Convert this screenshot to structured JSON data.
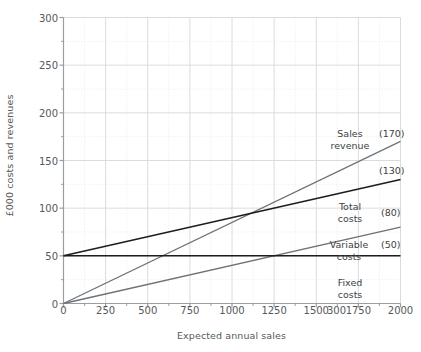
{
  "chart_data": {
    "type": "line",
    "title": "",
    "xlabel": "Expected annual sales",
    "ylabel": "£000 costs and revenues",
    "xlim": [
      0,
      2000
    ],
    "ylim": [
      0,
      300
    ],
    "grid": true,
    "legend_position": "inline-right-annotations",
    "x_ticks": [
      {
        "value": 0,
        "label": "0"
      },
      {
        "value": 250,
        "label": "250"
      },
      {
        "value": 500,
        "label": "500"
      },
      {
        "value": 750,
        "label": "750"
      },
      {
        "value": 1000,
        "label": "1000"
      },
      {
        "value": 1250,
        "label": "1250"
      },
      {
        "value": 1500,
        "label": "1500"
      },
      {
        "value": 1620,
        "label": "300"
      },
      {
        "value": 1750,
        "label": "1750"
      },
      {
        "value": 2000,
        "label": "2000"
      }
    ],
    "y_ticks": [
      {
        "value": 0,
        "label": "0"
      },
      {
        "value": 50,
        "label": "50"
      },
      {
        "value": 100,
        "label": "100"
      },
      {
        "value": 150,
        "label": "150"
      },
      {
        "value": 200,
        "label": "200"
      },
      {
        "value": 250,
        "label": "250"
      },
      {
        "value": 300,
        "label": "300"
      }
    ],
    "y_minor_ticks": [
      25,
      75,
      125,
      175,
      225,
      275
    ],
    "x_minor_ticks": [
      125,
      375,
      625,
      875,
      1125,
      1375,
      1625,
      1875
    ],
    "series": [
      {
        "name": "Sales revenue",
        "color": "#6e7276",
        "width": 1.3,
        "points": [
          [
            0,
            0
          ],
          [
            2000,
            170
          ]
        ],
        "end_value_label": "(170)"
      },
      {
        "name": "Total costs",
        "color": "#1b1d1f",
        "width": 1.5,
        "points": [
          [
            0,
            50
          ],
          [
            2000,
            130
          ]
        ],
        "end_value_label": "(130)"
      },
      {
        "name": "Variable costs",
        "color": "#6e7276",
        "width": 1.3,
        "points": [
          [
            0,
            0
          ],
          [
            2000,
            80
          ]
        ],
        "end_value_label": "(80)"
      },
      {
        "name": "Fixed costs",
        "color": "#1b1d1f",
        "width": 1.5,
        "points": [
          [
            0,
            50
          ],
          [
            2000,
            50
          ]
        ],
        "end_value_label": "(50)"
      }
    ],
    "annotations": [
      {
        "name": "sales-revenue-label",
        "text_line1": "Sales",
        "text_line2": "revenue",
        "value_label": "(170)"
      },
      {
        "name": "total-costs-value",
        "text_line1": "",
        "text_line2": "",
        "value_label": "(130)"
      },
      {
        "name": "total-costs-label",
        "text_line1": "Total",
        "text_line2": "costs",
        "value_label": "(80)"
      },
      {
        "name": "variable-costs-label",
        "text_line1": "Variable",
        "text_line2": "costs",
        "value_label": "(50)"
      },
      {
        "name": "fixed-costs-label",
        "text_line1": "Fixed",
        "text_line2": "costs",
        "value_label": ""
      }
    ],
    "colors": {
      "background": "#ffffff",
      "axis": "#9a9ea1",
      "major_grid": "#d9dcde",
      "minor_grid": "#e8eaec",
      "tick_text": "#55595c",
      "annotation_text": "#3b3f42"
    }
  },
  "labels": {
    "sales_revenue_l1": "Sales",
    "sales_revenue_l2": "revenue",
    "sales_revenue_value": "(170)",
    "total_costs_value": "(130)",
    "total_costs_l1": "Total",
    "total_costs_l2": "costs",
    "total_costs_end_value": "(80)",
    "variable_costs_l1": "Variable",
    "variable_costs_l2": "costs",
    "variable_costs_value": "(50)",
    "fixed_costs_l1": "Fixed",
    "fixed_costs_l2": "costs",
    "y_axis_title": "£000 costs and revenues",
    "x_axis_title": "Expected annual sales"
  }
}
